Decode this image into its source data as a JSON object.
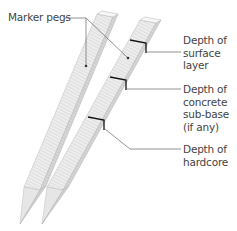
{
  "diagram": {
    "labels": {
      "marker_pegs": "Marker pegs",
      "surface": [
        "Depth of",
        "surface",
        "layer"
      ],
      "subbase": [
        "Depth of",
        "concrete",
        "sub-base",
        "(if any)"
      ],
      "hardcore": [
        "Depth of",
        "hardcore"
      ]
    },
    "colors": {
      "peg_front": "#ececec",
      "peg_side": "#d2d2d2",
      "peg_top": "#f6f6f6",
      "grain": "#c4c4c4",
      "leader": "#555555",
      "mark": "#111111"
    }
  }
}
